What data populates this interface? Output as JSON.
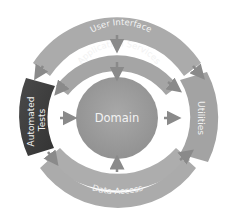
{
  "diagram": {
    "type": "onion-architecture",
    "layers": {
      "user_interface": "User Interface",
      "application_services": "Application Services",
      "domain": "Domain",
      "automated_tests": "Automated Tests",
      "utilities": "Utilities",
      "data_access": "Data Access"
    },
    "labels": {
      "automated_line1": "Automated",
      "automated_line2": "Tests"
    },
    "colors": {
      "ring": "#a3a3a3",
      "ring_light": "#b0b0b0",
      "domain": "#9a9a9a",
      "tests": "#3f3f3f",
      "arrow": "#8a8a8a",
      "text": "#f2f2f2",
      "background": "#ffffff"
    }
  }
}
